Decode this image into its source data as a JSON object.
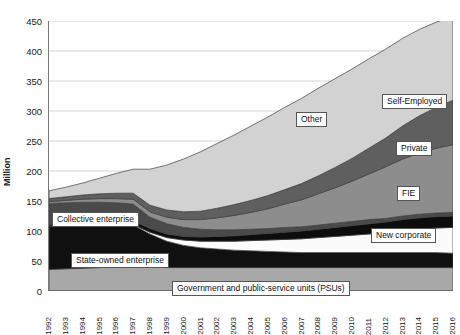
{
  "chart_data": {
    "type": "area",
    "title": "",
    "xlabel": "",
    "ylabel": "Million",
    "ylim": [
      0,
      450
    ],
    "ytick_step": 50,
    "yticks": [
      0,
      50,
      100,
      150,
      200,
      250,
      300,
      350,
      400,
      450
    ],
    "grid": true,
    "stacked": true,
    "legend_position": "in-plot-callouts",
    "x": [
      1992,
      1993,
      1994,
      1995,
      1996,
      1997,
      1998,
      1999,
      2000,
      2001,
      2002,
      2003,
      2004,
      2005,
      2006,
      2007,
      2008,
      2009,
      2010,
      2011,
      2012,
      2013,
      2014,
      2015,
      2016
    ],
    "categories": [
      "1992",
      "1993",
      "1994",
      "1995",
      "1996",
      "1997",
      "1998",
      "1999",
      "2000",
      "2001",
      "2002",
      "2003",
      "2004",
      "2005",
      "2006",
      "2007",
      "2008",
      "2009",
      "2010",
      "2011",
      "2012",
      "2013",
      "2014",
      "2015",
      "2016"
    ],
    "series": [
      {
        "name": "Government and public-service units (PSUs)",
        "color": "#a8a8a8",
        "values": [
          36,
          37,
          38,
          39,
          40,
          40,
          40,
          39,
          39,
          39,
          39,
          39,
          39,
          39,
          39,
          39,
          39,
          39,
          39,
          39,
          39,
          39,
          39,
          39,
          39
        ]
      },
      {
        "name": "State-owned enterprise",
        "color": "#101010",
        "values": [
          72,
          72,
          72,
          72,
          72,
          70,
          55,
          44,
          37,
          33,
          31,
          29,
          28,
          27,
          26,
          25,
          25,
          25,
          25,
          25,
          25,
          25,
          25,
          25,
          24
        ]
      },
      {
        "name": "New corporate",
        "color": "#fbfbfb",
        "values": [
          0,
          0,
          0,
          0,
          0,
          1,
          3,
          6,
          9,
          11,
          13,
          15,
          17,
          19,
          21,
          23,
          25,
          27,
          29,
          31,
          33,
          36,
          39,
          41,
          43
        ]
      },
      {
        "name": "FIE",
        "color": "#0d0d0d",
        "values": [
          2,
          3,
          4,
          5,
          5,
          6,
          6,
          6,
          6,
          7,
          8,
          9,
          10,
          11,
          12,
          13,
          14,
          15,
          16,
          17,
          18,
          19,
          19,
          19,
          19
        ]
      },
      {
        "name": "Collective enterprise",
        "color": "#4a4a4a",
        "values": [
          36,
          35,
          34,
          32,
          30,
          28,
          19,
          17,
          15,
          13,
          11,
          10,
          9,
          8,
          8,
          7,
          7,
          7,
          7,
          7,
          6,
          6,
          6,
          6,
          6
        ]
      },
      {
        "name": "Private",
        "color": "#8d8d8d",
        "values": [
          3,
          4,
          5,
          6,
          7,
          8,
          9,
          11,
          13,
          16,
          20,
          24,
          28,
          33,
          39,
          45,
          52,
          59,
          67,
          76,
          86,
          95,
          102,
          108,
          113
        ]
      },
      {
        "name": "Self-Employed",
        "color": "#5f5f5f",
        "values": [
          5,
          6,
          7,
          8,
          9,
          10,
          11,
          12,
          13,
          14,
          16,
          18,
          20,
          22,
          24,
          27,
          30,
          34,
          38,
          43,
          48,
          55,
          62,
          68,
          74
        ]
      },
      {
        "name": "Other",
        "color": "#d2d2d2",
        "values": [
          13,
          16,
          20,
          26,
          33,
          40,
          60,
          75,
          88,
          99,
          108,
          116,
          124,
          131,
          137,
          142,
          146,
          148,
          149,
          149,
          148,
          146,
          144,
          142,
          140
        ]
      }
    ],
    "totals": [
      167,
      173,
      180,
      188,
      196,
      203,
      203,
      210,
      220,
      232,
      246,
      260,
      275,
      290,
      306,
      321,
      338,
      354,
      370,
      387,
      403,
      421,
      436,
      448,
      458
    ],
    "callouts": [
      {
        "id": "other",
        "label": "Other"
      },
      {
        "id": "self-employed",
        "label": "Self-Employed"
      },
      {
        "id": "private",
        "label": "Private"
      },
      {
        "id": "fie",
        "label": "FIE"
      },
      {
        "id": "new-corporate",
        "label": "New corporate"
      },
      {
        "id": "collective-enterprise",
        "label": "Collective enterprise"
      },
      {
        "id": "state-owned-enterprise",
        "label": "State-owned enterprise"
      },
      {
        "id": "psus",
        "label": "Government and public-service units (PSUs)"
      }
    ]
  }
}
